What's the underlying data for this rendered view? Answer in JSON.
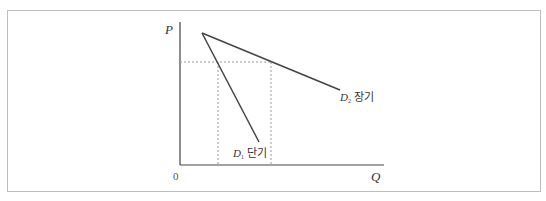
{
  "diagram": {
    "axes": {
      "y_label": "P",
      "x_label": "Q",
      "origin_label": "0"
    },
    "curves": [
      {
        "id": "D1",
        "symbol": "D",
        "subscript": "1",
        "label": "단기",
        "description": "short-run demand (steep)"
      },
      {
        "id": "D2",
        "symbol": "D",
        "subscript": "2",
        "label": "장기",
        "description": "long-run demand (flat)"
      }
    ],
    "colors": {
      "line": "#444444",
      "dashed": "#9a9a9a",
      "frame": "#bdbdbd",
      "text": "#333333"
    }
  }
}
